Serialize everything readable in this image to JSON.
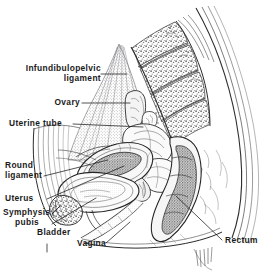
{
  "figure": {
    "type": "anatomical-line-drawing",
    "orientation": "sagittal",
    "style": "pen-and-ink with halftone stipple shading",
    "background_color": "#ffffff",
    "ink_color": "#2a2a2a",
    "tint_color": "#b9b9b9",
    "shade_color": "#8a8a8a"
  },
  "labels": [
    {
      "id": "infundibulopelvic-ligament",
      "line1": "Infundibulopelvic",
      "line2": "ligament"
    },
    {
      "id": "ovary",
      "text": "Ovary"
    },
    {
      "id": "uterine-tube",
      "text": "Uterine tube"
    },
    {
      "id": "round-ligament",
      "line1": "Round",
      "line2": "ligament"
    },
    {
      "id": "uterus",
      "text": "Uterus"
    },
    {
      "id": "symphysis-pubis",
      "line1": "Symphysis",
      "line2": "pubis"
    },
    {
      "id": "bladder",
      "text": "Bladder"
    },
    {
      "id": "vagina",
      "text": "Vagina"
    },
    {
      "id": "rectum",
      "text": "Rectum"
    }
  ],
  "structures": [
    "sacrum",
    "coccyx",
    "broad ligament",
    "ovary",
    "uterine tube",
    "uterus",
    "round ligament",
    "bladder",
    "symphysis pubis",
    "vagina",
    "rectum",
    "anterior abdominal wall",
    "gluteal contour"
  ]
}
